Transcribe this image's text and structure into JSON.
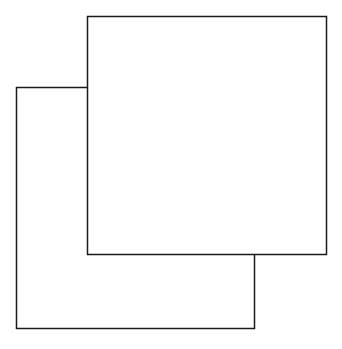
{
  "diagram": {
    "stroke_color": "#1a1a1a",
    "fill_color": "#ffffff",
    "background": "#ffffff",
    "shapes": [
      {
        "name": "back-square",
        "x": 16,
        "y": 87,
        "width": 238,
        "height": 241
      },
      {
        "name": "front-square",
        "x": 87,
        "y": 16,
        "width": 239,
        "height": 238
      }
    ]
  }
}
